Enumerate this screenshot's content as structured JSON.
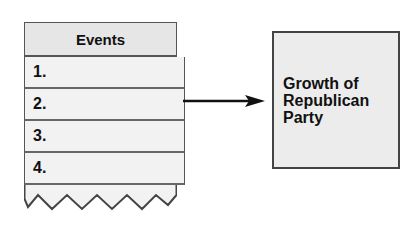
{
  "events_table": {
    "header": "Events",
    "rows": [
      {
        "label": "1.",
        "value": ""
      },
      {
        "label": "2.",
        "value": ""
      },
      {
        "label": "3.",
        "value": ""
      },
      {
        "label": "4.",
        "value": ""
      }
    ]
  },
  "arrow": {
    "direction": "right",
    "icon": "arrow-right-icon"
  },
  "result_box": {
    "line1": "Growth of",
    "line2": "Republican",
    "line3": "Party"
  },
  "colors": {
    "border": "#444444",
    "header_fill": "#e6e6e6",
    "row_fill": "#f2f2f2",
    "box_fill": "#ececec"
  }
}
